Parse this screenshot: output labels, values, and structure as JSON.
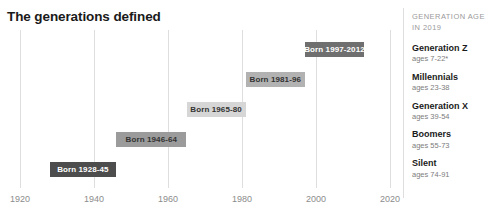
{
  "title": "The generations defined",
  "legend": {
    "header_line1": "GENERATION AGE",
    "header_line2": "IN 2019",
    "entries": [
      {
        "name": "Generation Z",
        "ages": "ages 7-22*"
      },
      {
        "name": "Millennials",
        "ages": "ages 23-38"
      },
      {
        "name": "Generation X",
        "ages": "ages 39-54"
      },
      {
        "name": "Boomers",
        "ages": "ages 55-73"
      },
      {
        "name": "Silent",
        "ages": "ages 74-91"
      }
    ]
  },
  "chart_data": {
    "type": "bar",
    "orientation": "horizontal",
    "title": "The generations defined",
    "xlabel": "",
    "ylabel": "",
    "xlim": [
      1920,
      2020
    ],
    "x_ticks": [
      1920,
      1940,
      1960,
      1980,
      2000,
      2020
    ],
    "x_tick_labels": [
      "1920",
      "1940",
      "1960",
      "1980",
      "2000",
      "2020"
    ],
    "grid": "vertical",
    "legend_position": "right",
    "categories": [
      "Generation Z",
      "Millennials",
      "Generation X",
      "Boomers",
      "Silent"
    ],
    "bars": [
      {
        "category": "Generation Z",
        "label": "Born 1997-2012",
        "start": 1997,
        "end": 2012,
        "color": "#6f6f6f",
        "text_color": "#ffffff"
      },
      {
        "category": "Millennials",
        "label": "Born 1981-96",
        "start": 1981,
        "end": 1996,
        "color": "#b2b2b2",
        "text_color": "#333333"
      },
      {
        "category": "Generation X",
        "label": "Born 1965-80",
        "start": 1965,
        "end": 1980,
        "color": "#d6d6d6",
        "text_color": "#333333"
      },
      {
        "category": "Boomers",
        "label": "Born 1946-64",
        "start": 1946,
        "end": 1964,
        "color": "#9b9b9b",
        "text_color": "#333333"
      },
      {
        "category": "Silent",
        "label": "Born 1928-45",
        "start": 1928,
        "end": 1945,
        "color": "#4d4d4d",
        "text_color": "#ffffff"
      }
    ],
    "colors": {
      "grid": "#dedede",
      "tick_text": "#8c8c8c",
      "title_text": "#1a1a1a",
      "legend_header_text": "#9a9a9a",
      "legend_name_text": "#1a1a1a",
      "legend_ages_text": "#7d7d7d",
      "background": "#ffffff"
    }
  }
}
